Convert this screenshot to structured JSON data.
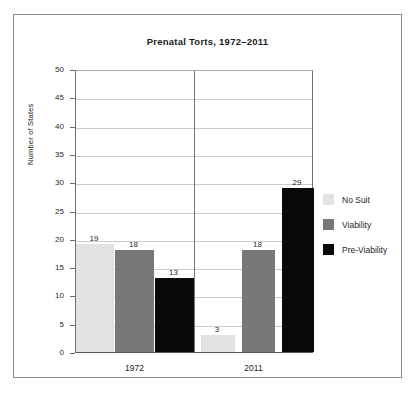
{
  "chart_data": {
    "type": "bar",
    "title": "Prenatal Torts, 1972–2011",
    "xlabel": "",
    "ylabel": "Number of States",
    "categories": [
      "1972",
      "2011"
    ],
    "ylim": [
      0,
      50
    ],
    "ytick_step": 5,
    "yticks": [
      "50",
      "45",
      "40",
      "35",
      "30",
      "25",
      "20",
      "15",
      "10",
      "5",
      "0"
    ],
    "grid": true,
    "legend_position": "right",
    "series": [
      {
        "name": "No Suit",
        "color": "#e2e2e2",
        "values": [
          19,
          3
        ]
      },
      {
        "name": "Viability",
        "color": "#787878",
        "values": [
          18,
          18
        ]
      },
      {
        "name": "Pre-Viability",
        "color": "#090909",
        "values": [
          13,
          29
        ]
      }
    ],
    "data_labels": [
      {
        "category": "1972",
        "series": "No Suit",
        "value": "19"
      },
      {
        "category": "1972",
        "series": "Viability",
        "value": "18"
      },
      {
        "category": "1972",
        "series": "Pre-Viability",
        "value": "13"
      },
      {
        "category": "2011",
        "series": "No Suit",
        "value": "3"
      },
      {
        "category": "2011",
        "series": "Viability",
        "value": "18"
      },
      {
        "category": "2011",
        "series": "Pre-Viability",
        "value": "29"
      }
    ]
  },
  "legend": {
    "items": [
      {
        "label": "No Suit",
        "swatch": "swatch-nosuit"
      },
      {
        "label": "Viability",
        "swatch": "swatch-viability"
      },
      {
        "label": "Pre-Viability",
        "swatch": "swatch-previability"
      }
    ]
  },
  "colors": {
    "no_suit": "#e2e2e2",
    "viability": "#787878",
    "pre_viability": "#090909",
    "frame": "#8d8f92",
    "gridline": "#c9cbce",
    "text": "#1b1b1b"
  }
}
